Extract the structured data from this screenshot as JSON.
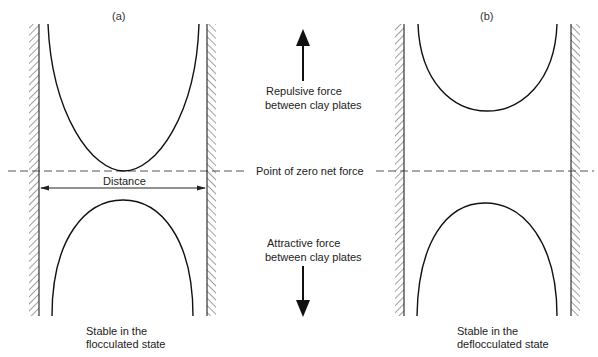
{
  "panels": [
    {
      "id": "a",
      "label": "(a)",
      "caption_line1": "Stable in the",
      "caption_line2": "flocculated state",
      "distance_label": "Distance"
    },
    {
      "id": "b",
      "label": "(b)",
      "caption_line1": "Stable in the",
      "caption_line2": "deflocculated state"
    }
  ],
  "center": {
    "repulsive_line1": "Repulsive force",
    "repulsive_line2": "between clay plates",
    "zero_line": "Point of zero net force",
    "attractive_line1": "Attractive force",
    "attractive_line2": "between clay plates"
  },
  "icons": {
    "up_arrow": "arrow-up-icon",
    "down_arrow": "arrow-down-icon"
  },
  "colors": {
    "line": "#111111",
    "dashed": "#555555",
    "background": "#ffffff"
  }
}
